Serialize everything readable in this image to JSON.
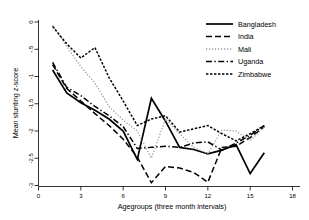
{
  "chart_data": {
    "type": "line",
    "title": "",
    "xlabel": "Agegroups (three month intervals)",
    "ylabel": "Mean stunting z-score",
    "xlim": [
      0,
      18
    ],
    "ylim": [
      -3,
      0
    ],
    "grid": false,
    "legend_position": "top-right",
    "xticks": [
      0,
      3,
      6,
      9,
      12,
      15,
      18
    ],
    "xtick_labels": [
      "0",
      "3",
      "6",
      "9",
      "12",
      "15",
      "18"
    ],
    "yticks": [
      0,
      -0.5,
      -1,
      -1.5,
      -2,
      -2.5,
      -3
    ],
    "ytick_labels": [
      "0",
      "-.5",
      "-1",
      "-1.5",
      "-2",
      "-2.5",
      "-3"
    ],
    "series": [
      {
        "name": "Bangladesh",
        "style": "solid",
        "color": "#000000",
        "width": 1.7,
        "x": [
          1,
          2,
          3,
          4,
          5,
          6,
          7,
          8,
          9,
          10,
          11,
          12,
          13,
          14,
          15,
          16
        ],
        "values": [
          -0.88,
          -1.3,
          -1.48,
          -1.62,
          -1.78,
          -2.0,
          -2.52,
          -1.4,
          -1.82,
          -2.3,
          -2.34,
          -2.42,
          -2.35,
          -2.25,
          -2.78,
          -2.4
        ]
      },
      {
        "name": "India",
        "style": "dashed",
        "color": "#000000",
        "width": 1.5,
        "x": [
          1,
          2,
          3,
          4,
          5,
          6,
          7,
          8,
          9,
          10,
          11,
          12,
          13,
          14,
          15,
          16
        ],
        "values": [
          -0.78,
          -1.22,
          -1.45,
          -1.68,
          -1.9,
          -2.15,
          -2.48,
          -2.95,
          -2.65,
          -2.68,
          -2.76,
          -2.94,
          -2.3,
          -2.28,
          -2.12,
          -1.92
        ]
      },
      {
        "name": "Mali",
        "style": "dotted",
        "color": "#9a9a9a",
        "width": 1.3,
        "x": [
          1,
          2,
          3,
          4,
          5,
          6,
          7,
          8,
          9,
          10,
          11,
          12,
          13,
          14,
          15,
          16
        ],
        "values": [
          -0.06,
          -0.45,
          -0.82,
          -1.12,
          -1.55,
          -1.8,
          -2.0,
          -2.5,
          -1.78,
          -2.05,
          -2.3,
          -2.42,
          -1.98,
          -2.0,
          -2.18,
          -1.92
        ]
      },
      {
        "name": "Uganda",
        "style": "dash-dot",
        "color": "#000000",
        "width": 1.5,
        "x": [
          1,
          2,
          3,
          4,
          5,
          6,
          7,
          8,
          9,
          10,
          11,
          12,
          13,
          14,
          15,
          16
        ],
        "values": [
          -0.74,
          -1.2,
          -1.35,
          -1.55,
          -1.72,
          -1.92,
          -2.32,
          -2.3,
          -2.28,
          -2.3,
          -2.22,
          -2.2,
          -2.35,
          -2.22,
          -2.08,
          -1.9
        ]
      },
      {
        "name": "Zimbabwe",
        "style": "fine-dotted",
        "color": "#000000",
        "width": 1.5,
        "x": [
          1,
          2,
          3,
          4,
          5,
          6,
          7,
          8,
          9,
          10,
          11,
          12,
          13,
          14,
          15,
          16
        ],
        "values": [
          -0.08,
          -0.4,
          -0.66,
          -0.47,
          -1.02,
          -1.45,
          -1.9,
          -1.78,
          -1.72,
          -2.02,
          -1.96,
          -1.9,
          -2.05,
          -2.18,
          -2.05,
          -1.9
        ]
      }
    ]
  }
}
